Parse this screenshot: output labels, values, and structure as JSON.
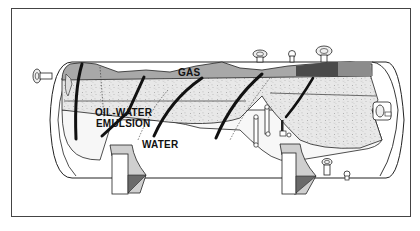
{
  "diagram": {
    "labels": {
      "gas": "GAS",
      "emulsion_line1": "OIL-WATER",
      "emulsion_line2": "EMULSION",
      "water": "WATER"
    },
    "colors": {
      "frame": "#444444",
      "outline": "#222222",
      "gas_zone": "#a9a9a9",
      "gas_dark": "#555555",
      "emulsion_zone": "#e6e6e6",
      "emulsion_speckle": "#7a7a7a",
      "water_zone": "#f6f6f6",
      "baffle": "#111111",
      "saddle_shadow": "#6e6e6e",
      "saddle_top": "#cfcfcf"
    },
    "components": [
      "gas-layer",
      "oil-water-emulsion-layer",
      "water-layer",
      "inlet-nozzle",
      "inclined-baffles",
      "saddle-supports",
      "top-flanged-nozzles",
      "sight-glasses",
      "bottom-drain-valves",
      "outlet-nozzle"
    ]
  }
}
